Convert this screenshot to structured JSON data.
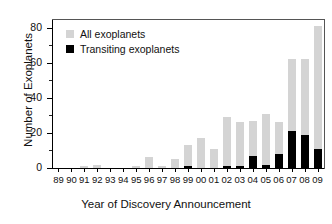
{
  "chart_data": {
    "type": "bar",
    "title": "",
    "subtitle": "",
    "xlabel": "Year of Discovery Announcement",
    "ylabel": "Number of Exoplanets",
    "stacked": true,
    "grid": false,
    "legend_position": "top-left",
    "ylim": [
      0,
      85
    ],
    "yticks": [
      0,
      20,
      40,
      60,
      80
    ],
    "ytick_labels": [
      "0",
      "20",
      "40",
      "60",
      "80"
    ],
    "yminor_ticks": [
      10,
      30,
      50,
      70
    ],
    "categories": [
      "89",
      "90",
      "91",
      "92",
      "93",
      "94",
      "95",
      "96",
      "97",
      "98",
      "99",
      "00",
      "01",
      "02",
      "03",
      "04",
      "05",
      "06",
      "07",
      "08",
      "09"
    ],
    "series": [
      {
        "name": "All exoplanets",
        "color": "#d4d4d4",
        "values": [
          0,
          0,
          1,
          2,
          0,
          0,
          1,
          6,
          1,
          5,
          13,
          17,
          11,
          29,
          26,
          27,
          31,
          26,
          62,
          62,
          81
        ]
      },
      {
        "name": "Transiting exoplanets",
        "color": "#000000",
        "values": [
          0,
          0,
          0,
          0,
          0,
          0,
          0,
          0,
          0,
          0,
          1,
          0,
          0,
          1,
          1,
          7,
          2,
          8,
          21,
          19,
          11
        ]
      }
    ]
  },
  "legend": {
    "items": [
      {
        "label": "All exoplanets",
        "color": "#d4d4d4"
      },
      {
        "label": "Transiting exoplanets",
        "color": "#000000"
      }
    ]
  }
}
